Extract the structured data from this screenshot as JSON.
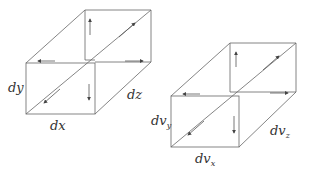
{
  "diagram": {
    "colors": {
      "line": "#555555",
      "arrow": "#444444",
      "text": "#333333"
    },
    "left_box": {
      "labels": {
        "x": "dx",
        "y": "dy",
        "z": "dz"
      }
    },
    "right_box": {
      "labels": {
        "x_base": "dv",
        "x_sub": "x",
        "y_base": "dv",
        "y_sub": "y",
        "z_base": "dv",
        "z_sub": "z"
      }
    }
  }
}
